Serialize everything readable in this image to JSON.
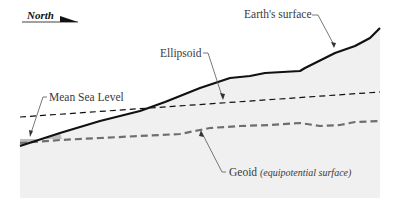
{
  "diagram": {
    "north_indicator": {
      "label": "North",
      "icon": "north-arrow-icon"
    },
    "labels": {
      "earth_surface": "Earth's surface",
      "ellipsoid": "Ellipsoid",
      "mean_sea_level": "Mean Sea Level",
      "geoid": "Geoid",
      "geoid_subtitle": "(equipotential surface)"
    },
    "colors": {
      "earth_surface_line": "#111111",
      "ellipsoid_line": "#111111",
      "geoid_line": "#6e6e6e",
      "land_fill": "#f0f0f0",
      "ocean_fill": "#bdbdbd",
      "leader_line": "#555555",
      "label_text": "#3a3a3a"
    },
    "lines": [
      {
        "name": "Earth's surface",
        "style": "solid",
        "thickness": "thick"
      },
      {
        "name": "Ellipsoid",
        "style": "dashed",
        "thickness": "thin"
      },
      {
        "name": "Geoid",
        "style": "dashed",
        "thickness": "thick"
      }
    ]
  }
}
